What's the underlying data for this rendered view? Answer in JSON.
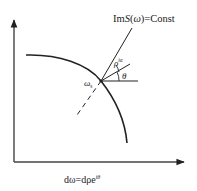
{
  "diagram": {
    "title_label": "ImS(ω)=Const",
    "title_parts": {
      "prefix": "Im",
      "func": "S",
      "arg_open": "(",
      "arg": "ω",
      "arg_close": ")",
      "suffix": "=Const"
    },
    "saddle_label": {
      "symbol": "ω",
      "subscript": "s"
    },
    "angle_labels": {
      "outer": {
        "symbol": "ρ",
        "superscript": "iα"
      },
      "inner": "θ"
    },
    "bottom_equation": {
      "lhs": "dω=dρe",
      "superscript": "iθ"
    },
    "colors": {
      "stroke": "#222222",
      "background": "#ffffff"
    }
  }
}
